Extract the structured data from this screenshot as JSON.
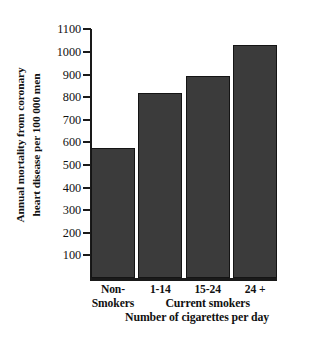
{
  "chart_data": {
    "type": "bar",
    "title": "",
    "subtitle": "",
    "categories": [
      "Non-Smokers",
      "1-14",
      "15-24",
      "24 +"
    ],
    "category_lines": [
      [
        "Non-",
        "Smokers"
      ],
      [
        "1-14"
      ],
      [
        "15-24"
      ],
      [
        "24 +"
      ]
    ],
    "values": [
      575,
      820,
      895,
      1030
    ],
    "xlabel": "Number of cigarettes per day",
    "ylabel": "Annual mortality from coronary heart disease per 100 000 men",
    "ylabel_lines": [
      "Annual mortality from coronary",
      "heart disease per 100 000 men"
    ],
    "ylim": [
      0,
      1140
    ],
    "ytick_values": [
      100,
      200,
      300,
      400,
      500,
      600,
      700,
      800,
      900,
      1000,
      1100
    ],
    "ytick_labels": [
      "100",
      "200",
      "300",
      "400",
      "500",
      "600",
      "700",
      "800",
      "900",
      "1000",
      "1100"
    ],
    "grid": false,
    "legend": false,
    "legend_position": "none",
    "group_annotation": {
      "label": "Current smokers",
      "spans_categories": [
        "1-14",
        "15-24",
        "24 +"
      ]
    },
    "bar_color": "#3b3b3b",
    "bar_edge_color": "#141414",
    "axis_color": "#1a1a1a",
    "background_color": "#ffffff"
  }
}
